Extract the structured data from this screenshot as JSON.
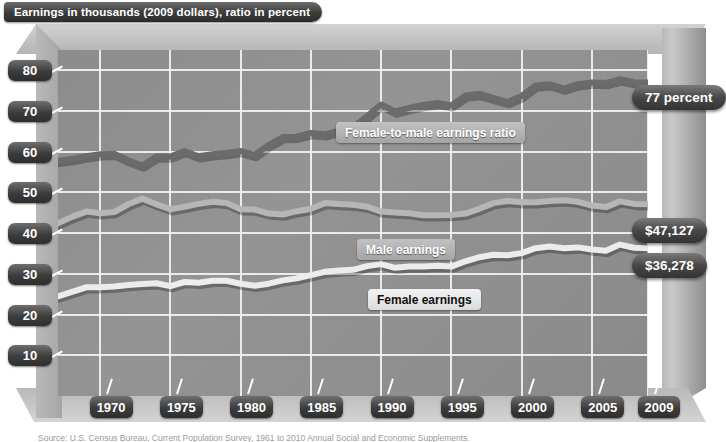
{
  "title": "Earnings in thousands (2009 dollars), ratio in percent",
  "source": "Source: U.S. Census Bureau, Current Population Survey, 1961 to 2010 Annual Social and Economic Supplements.",
  "callouts": {
    "ratio": "77 percent",
    "male": "$47,127",
    "female": "$36,278"
  },
  "series_labels": {
    "ratio": "Female-to-male earnings ratio",
    "male": "Male earnings",
    "female": "Female earnings"
  },
  "colors": {
    "ratio_line": "#6b6b6b",
    "male_line": "#b6b6b6",
    "female_line": "#ececec",
    "plot_bg": "#909090",
    "grid": "#f2f2f2",
    "pill_dark": "#3c3c3c"
  },
  "chart_data": {
    "type": "line",
    "title": "Earnings in thousands (2009 dollars), ratio in percent",
    "xlabel": "",
    "ylabel": "Earnings in thousands (2009 dollars), ratio in percent",
    "grid": true,
    "legend": "in-plot labels",
    "xlim": [
      1967,
      2009
    ],
    "ylim": [
      0,
      85
    ],
    "ytick_labels": [
      "80",
      "70",
      "60",
      "50",
      "40",
      "30",
      "20",
      "10"
    ],
    "yticks": [
      80,
      70,
      60,
      50,
      40,
      30,
      20,
      10
    ],
    "xtick_labels": [
      "1970",
      "1975",
      "1980",
      "1985",
      "1990",
      "1995",
      "2000",
      "2005",
      "2009"
    ],
    "xticks": [
      1970,
      1975,
      1980,
      1985,
      1990,
      1995,
      2000,
      2005,
      2009
    ],
    "x": [
      1967,
      1968,
      1969,
      1970,
      1971,
      1972,
      1973,
      1974,
      1975,
      1976,
      1977,
      1978,
      1979,
      1980,
      1981,
      1982,
      1983,
      1984,
      1985,
      1986,
      1987,
      1988,
      1989,
      1990,
      1991,
      1992,
      1993,
      1994,
      1995,
      1996,
      1997,
      1998,
      1999,
      2000,
      2001,
      2002,
      2003,
      2004,
      2005,
      2006,
      2007,
      2008,
      2009
    ],
    "series": [
      {
        "name": "Female-to-male earnings ratio",
        "unit": "percent",
        "color": "#6b6b6b",
        "end_label": "77 percent",
        "values": [
          57.8,
          58.2,
          58.9,
          59.4,
          59.5,
          57.9,
          56.6,
          58.8,
          58.8,
          60.2,
          58.9,
          59.4,
          59.7,
          60.2,
          59.2,
          61.7,
          63.6,
          63.7,
          64.6,
          64.3,
          65.2,
          66.0,
          68.7,
          71.6,
          69.9,
          70.8,
          71.5,
          72.0,
          71.4,
          73.8,
          74.2,
          73.2,
          72.2,
          73.7,
          76.3,
          76.6,
          75.5,
          76.6,
          77.0,
          76.9,
          77.8,
          77.1,
          77.0
        ]
      },
      {
        "name": "Male earnings",
        "unit": "thousands of 2009 dollars",
        "color": "#b6b6b6",
        "end_label": "$47,127",
        "values": [
          42.4,
          44.0,
          45.3,
          44.9,
          45.2,
          47.1,
          48.5,
          47.1,
          45.9,
          46.5,
          47.2,
          47.7,
          47.4,
          45.9,
          45.8,
          44.8,
          44.6,
          45.4,
          46.0,
          47.4,
          47.2,
          47.0,
          46.5,
          45.3,
          45.1,
          44.9,
          44.4,
          44.4,
          44.5,
          44.8,
          46.0,
          47.4,
          47.9,
          47.6,
          47.6,
          47.9,
          48.1,
          47.7,
          46.8,
          46.4,
          47.8,
          47.2,
          47.1
        ]
      },
      {
        "name": "Female earnings",
        "unit": "thousands of 2009 dollars",
        "color": "#ececec",
        "end_label": "$36,278",
        "values": [
          24.5,
          25.6,
          26.7,
          26.7,
          26.9,
          27.3,
          27.5,
          27.7,
          27.0,
          28.0,
          27.8,
          28.3,
          28.3,
          27.6,
          27.1,
          27.6,
          28.4,
          28.9,
          29.7,
          30.5,
          30.8,
          31.0,
          31.9,
          32.4,
          31.5,
          31.8,
          31.8,
          32.0,
          31.8,
          33.1,
          34.1,
          34.7,
          34.6,
          35.1,
          36.3,
          36.7,
          36.3,
          36.5,
          36.0,
          35.7,
          37.2,
          36.4,
          36.3
        ]
      }
    ],
    "annotations": [
      {
        "text": "77 percent",
        "series": "Female-to-male earnings ratio",
        "x": 2009
      },
      {
        "text": "$47,127",
        "series": "Male earnings",
        "x": 2009
      },
      {
        "text": "$36,278",
        "series": "Female earnings",
        "x": 2009
      }
    ]
  }
}
